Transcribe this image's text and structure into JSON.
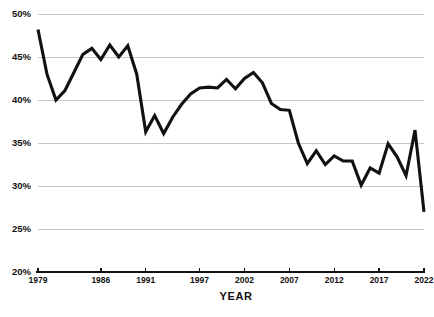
{
  "chart_data": {
    "type": "line",
    "title": "",
    "xlabel": "YEAR",
    "ylabel": "",
    "xlim": [
      1979,
      2022
    ],
    "ylim": [
      20,
      50
    ],
    "grid": true,
    "legend": "none",
    "ytick_labels": [
      "50%",
      "45%",
      "40%",
      "35%",
      "30%",
      "25%",
      "20%"
    ],
    "ytick_values": [
      50,
      45,
      40,
      35,
      30,
      25,
      20
    ],
    "xtick_labels": [
      "1979",
      "1986",
      "1991",
      "1997",
      "2002",
      "2007",
      "2012",
      "2017",
      "2022"
    ],
    "xtick_values": [
      1979,
      1986,
      1991,
      1997,
      2002,
      2007,
      2012,
      2017,
      2022
    ],
    "x": [
      1979,
      1980,
      1981,
      1982,
      1983,
      1984,
      1985,
      1986,
      1987,
      1988,
      1989,
      1990,
      1991,
      1992,
      1993,
      1994,
      1995,
      1996,
      1997,
      1998,
      1999,
      2000,
      2001,
      2002,
      2003,
      2004,
      2005,
      2006,
      2007,
      2008,
      2009,
      2010,
      2011,
      2012,
      2013,
      2014,
      2015,
      2016,
      2017,
      2018,
      2019,
      2020,
      2021,
      2022
    ],
    "values": [
      48.2,
      43.0,
      40.0,
      41.1,
      43.2,
      45.3,
      46.0,
      44.7,
      46.4,
      45.0,
      46.3,
      43.0,
      36.3,
      38.2,
      36.1,
      38.0,
      39.5,
      40.7,
      41.4,
      41.5,
      41.4,
      42.4,
      41.3,
      42.5,
      43.2,
      42.0,
      39.6,
      38.9,
      38.8,
      35.0,
      32.6,
      34.1,
      32.5,
      33.5,
      32.9,
      32.9,
      30.1,
      32.1,
      31.5,
      34.9,
      33.4,
      31.2,
      36.5,
      27.0
    ],
    "series": [
      {
        "name": "rate",
        "values": [
          48.2,
          43.0,
          40.0,
          41.1,
          43.2,
          45.3,
          46.0,
          44.7,
          46.4,
          45.0,
          46.3,
          43.0,
          36.3,
          38.2,
          36.1,
          38.0,
          39.5,
          40.7,
          41.4,
          41.5,
          41.4,
          42.4,
          41.3,
          42.5,
          43.2,
          42.0,
          39.6,
          38.9,
          38.8,
          35.0,
          32.6,
          34.1,
          32.5,
          33.5,
          32.9,
          32.9,
          30.1,
          32.1,
          31.5,
          34.9,
          33.4,
          31.2,
          36.5,
          27.0
        ]
      }
    ],
    "colors": {
      "line": "#111111",
      "grid": "#b9b9b9",
      "axis": "#111111",
      "background": "#ffffff",
      "text": "#111111"
    }
  }
}
